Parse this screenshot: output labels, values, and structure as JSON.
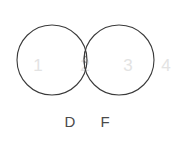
{
  "diagram": {
    "kind": "venn-diagram",
    "sets_count": 2,
    "background_color": "#ffffff",
    "stroke_color": "#3a3a3a",
    "region_number_color": "#e3e3e3",
    "label_color": "#4a4a4a",
    "hatch_color": "#3a3a3a",
    "canvas": {
      "width": 178,
      "height": 142
    }
  },
  "circles": [
    {
      "id": "left",
      "label": "D",
      "cx": 52,
      "cy": 60,
      "r": 35
    },
    {
      "id": "right",
      "label": "F",
      "cx": 119,
      "cy": 60,
      "r": 35
    }
  ],
  "labels": {
    "left_set": "D",
    "right_set": "F",
    "left_set_x": 70,
    "left_set_y": 123,
    "right_set_x": 105,
    "right_set_y": 123
  },
  "regions": [
    {
      "id": "left-only",
      "number": "1",
      "x": 38,
      "y": 67,
      "shaded": false
    },
    {
      "id": "intersection",
      "number": "2",
      "x": 85,
      "y": 67,
      "shaded": true
    },
    {
      "id": "right-only",
      "number": "3",
      "x": 128,
      "y": 67,
      "shaded": false
    },
    {
      "id": "outside",
      "number": "4",
      "x": 166,
      "y": 67,
      "shaded": false
    }
  ],
  "shading": {
    "region": "intersection",
    "style": "diagonal-hatch",
    "direction": "lower-left-to-upper-right",
    "spacing_px": 4
  }
}
